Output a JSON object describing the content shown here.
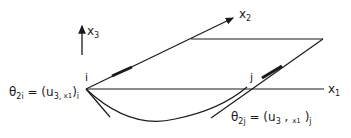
{
  "diagram": {
    "axes": {
      "x1": {
        "label": "x",
        "sub": "1"
      },
      "x2": {
        "label": "x",
        "sub": "2"
      },
      "x3": {
        "label": "x",
        "sub": "3"
      }
    },
    "nodes": {
      "i": "i",
      "j": "j"
    },
    "equations": {
      "theta_i": {
        "lhs": "θ",
        "lhs_sub": "2i",
        "eq": " = (u",
        "u_sub": "3,",
        "x": " x",
        "x_sub": "1",
        "close": ")",
        "close_sub": "i"
      },
      "theta_j": {
        "lhs": "θ",
        "lhs_sub": "2j",
        "eq": " = (u",
        "u_sub": "3",
        "sep": " , ",
        "x": "x",
        "x_sub": "1",
        "close": " )",
        "close_sub": "j"
      }
    },
    "colors": {
      "stroke": "#1a1a1a",
      "background": "#ffffff"
    }
  }
}
